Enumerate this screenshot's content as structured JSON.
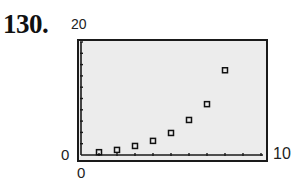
{
  "problem": {
    "number": "130."
  },
  "window": {
    "xmin_label": "0",
    "xmax_label": "10",
    "ymin_label": "0",
    "ymax_label": "20"
  },
  "colors": {
    "screen_bg": "#ececec",
    "frame": "#1a1a1a",
    "marker": "#111111"
  },
  "chart_data": {
    "type": "scatter",
    "title": "",
    "xlabel": "",
    "ylabel": "",
    "xlim": [
      0,
      10
    ],
    "ylim": [
      0,
      20
    ],
    "x_tick_step": 1,
    "y_tick_step": 2,
    "grid": false,
    "legend": null,
    "marker": "hollow-square",
    "series": [
      {
        "name": "data",
        "x": [
          1,
          2,
          3,
          4,
          5,
          6,
          7,
          8
        ],
        "y": [
          0.5,
          0.9,
          1.6,
          2.5,
          3.9,
          6.2,
          9.0,
          15.0
        ]
      }
    ]
  }
}
